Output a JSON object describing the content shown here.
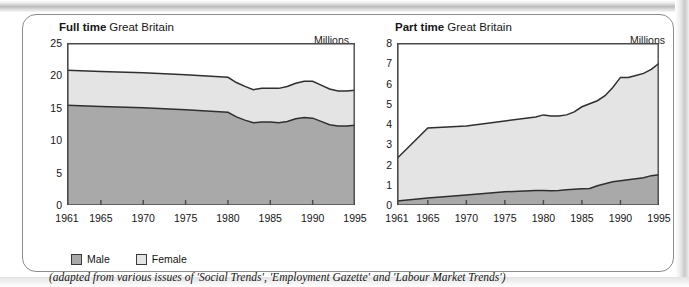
{
  "figure": {
    "units_label": "Millions",
    "caption": "(adapted from various issues of 'Social Trends', 'Employment Gazette' and 'Labour Market Trends')"
  },
  "legend": {
    "items": [
      {
        "label": "Male",
        "color": "#a9a9a9"
      },
      {
        "label": "Female",
        "color": "#e4e4e4"
      }
    ]
  },
  "colors": {
    "male_fill": "#a9a9a9",
    "female_fill": "#e4e4e4",
    "line": "#2f2f2f",
    "axis": "#4a4a4a",
    "border": "#8d8d8d"
  },
  "chart_data": [
    {
      "type": "area",
      "id": "full-time",
      "title": "Full time",
      "subtitle": "Great Britain",
      "ylabel": "Millions",
      "xlabel": "",
      "stacked": true,
      "grid": false,
      "legend_position": "below",
      "xlim": [
        1961,
        1995
      ],
      "ylim": [
        0,
        25
      ],
      "yticks": [
        0,
        5,
        10,
        15,
        20,
        25
      ],
      "xticks": [
        1961,
        1965,
        1970,
        1975,
        1980,
        1985,
        1990,
        1995
      ],
      "x": [
        1961,
        1965,
        1970,
        1975,
        1979,
        1980,
        1981,
        1982,
        1983,
        1984,
        1985,
        1986,
        1987,
        1988,
        1989,
        1990,
        1991,
        1992,
        1993,
        1994,
        1995
      ],
      "series": [
        {
          "name": "Male",
          "values": [
            15.4,
            15.2,
            15.0,
            14.7,
            14.4,
            14.3,
            13.6,
            13.1,
            12.7,
            12.8,
            12.8,
            12.7,
            12.9,
            13.3,
            13.5,
            13.4,
            12.9,
            12.4,
            12.2,
            12.2,
            12.3
          ]
        },
        {
          "name": "Female",
          "values": [
            5.4,
            5.4,
            5.4,
            5.4,
            5.4,
            5.4,
            5.3,
            5.2,
            5.1,
            5.2,
            5.2,
            5.3,
            5.4,
            5.5,
            5.6,
            5.7,
            5.6,
            5.5,
            5.4,
            5.4,
            5.4
          ]
        }
      ],
      "totals": [
        20.8,
        20.6,
        20.4,
        20.1,
        19.8,
        19.7,
        18.9,
        18.3,
        17.8,
        18.0,
        18.0,
        18.0,
        18.3,
        18.8,
        19.1,
        19.1,
        18.5,
        17.9,
        17.6,
        17.6,
        17.7
      ]
    },
    {
      "type": "area",
      "id": "part-time",
      "title": "Part time",
      "subtitle": "Great Britain",
      "ylabel": "Millions",
      "xlabel": "",
      "stacked": true,
      "grid": false,
      "legend_position": "below",
      "xlim": [
        1961,
        1995
      ],
      "ylim": [
        0,
        8
      ],
      "yticks": [
        0,
        1,
        2,
        3,
        4,
        5,
        6,
        7,
        8
      ],
      "xticks": [
        1961,
        1965,
        1970,
        1975,
        1980,
        1985,
        1990,
        1995
      ],
      "x": [
        1961,
        1965,
        1970,
        1975,
        1979,
        1980,
        1981,
        1982,
        1983,
        1984,
        1985,
        1986,
        1987,
        1988,
        1989,
        1990,
        1991,
        1992,
        1993,
        1994,
        1995
      ],
      "series": [
        {
          "name": "Male",
          "values": [
            0.2,
            0.35,
            0.5,
            0.65,
            0.72,
            0.72,
            0.7,
            0.72,
            0.75,
            0.78,
            0.8,
            0.82,
            0.95,
            1.05,
            1.15,
            1.2,
            1.25,
            1.3,
            1.35,
            1.45,
            1.5
          ]
        },
        {
          "name": "Female",
          "values": [
            2.1,
            3.45,
            3.4,
            3.5,
            3.63,
            3.73,
            3.7,
            3.68,
            3.7,
            3.82,
            4.05,
            4.18,
            4.2,
            4.35,
            4.65,
            5.1,
            5.05,
            5.1,
            5.15,
            5.25,
            5.5
          ]
        }
      ],
      "totals": [
        2.3,
        3.8,
        3.9,
        4.15,
        4.35,
        4.45,
        4.4,
        4.4,
        4.45,
        4.6,
        4.85,
        5.0,
        5.15,
        5.4,
        5.8,
        6.3,
        6.3,
        6.4,
        6.5,
        6.7,
        7.0
      ]
    }
  ]
}
